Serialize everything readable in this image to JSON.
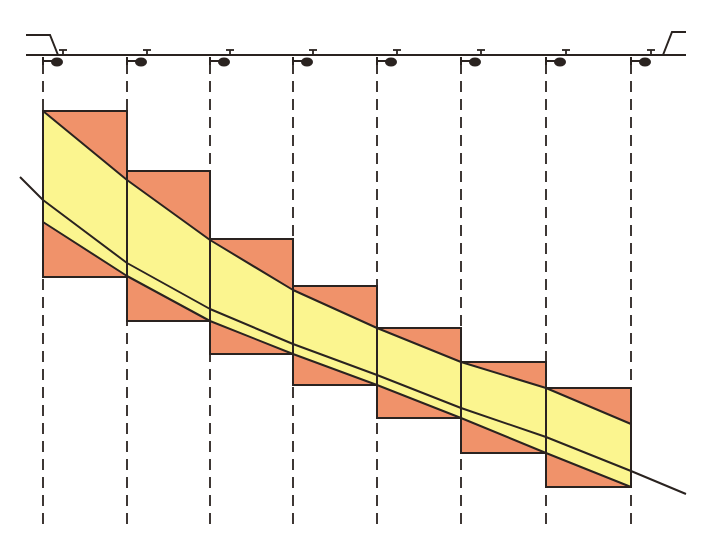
{
  "diagram": {
    "title": "Sprinkler irrigation uniformity diagram",
    "colors": {
      "background": "#ffffff",
      "rect_fill": "#f0926a",
      "band_fill": "#fbf58f",
      "line": "#2a2320",
      "dash": "#2a2320"
    },
    "pipe": {
      "y": 55,
      "x_start": 26,
      "x_end": 686,
      "left_riser": [
        [
          26,
          35
        ],
        [
          50,
          35
        ],
        [
          58,
          55
        ]
      ],
      "right_riser": [
        [
          663,
          55
        ],
        [
          672,
          32
        ],
        [
          686,
          32
        ]
      ]
    },
    "sprinkler_positions": [
      43,
      127,
      210,
      293,
      377,
      461,
      546,
      631
    ],
    "sprinkler_icon": "sprinkler-head-icon",
    "dashed_line_bottom": 530,
    "rectangles": [
      {
        "x1": 43,
        "x2": 127,
        "top": 111,
        "bottom": 277
      },
      {
        "x1": 127,
        "x2": 210,
        "top": 171,
        "bottom": 321
      },
      {
        "x1": 210,
        "x2": 293,
        "top": 239,
        "bottom": 354
      },
      {
        "x1": 293,
        "x2": 377,
        "top": 286,
        "bottom": 385
      },
      {
        "x1": 377,
        "x2": 461,
        "top": 328,
        "bottom": 418
      },
      {
        "x1": 461,
        "x2": 546,
        "top": 362,
        "bottom": 453
      },
      {
        "x1": 546,
        "x2": 631,
        "top": 388,
        "bottom": 487
      }
    ],
    "band_upper": [
      [
        43,
        111
      ],
      [
        127,
        180
      ],
      [
        210,
        240
      ],
      [
        293,
        290
      ],
      [
        377,
        328
      ],
      [
        461,
        362
      ],
      [
        546,
        388
      ],
      [
        631,
        424
      ]
    ],
    "band_lower": [
      [
        43,
        222
      ],
      [
        127,
        276
      ],
      [
        210,
        321
      ],
      [
        293,
        354
      ],
      [
        377,
        385
      ],
      [
        461,
        418
      ],
      [
        546,
        453
      ],
      [
        631,
        487
      ]
    ],
    "mean_line": [
      [
        20,
        177
      ],
      [
        43,
        200
      ],
      [
        127,
        263
      ],
      [
        210,
        309
      ],
      [
        293,
        344
      ],
      [
        377,
        375
      ],
      [
        461,
        408
      ],
      [
        546,
        437
      ],
      [
        631,
        471
      ],
      [
        686,
        494
      ]
    ]
  }
}
